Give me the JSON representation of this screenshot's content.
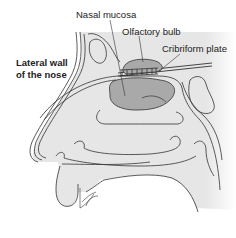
{
  "diagram": {
    "labels": {
      "nasal_mucosa": "Nasal mucosa",
      "olfactory_bulb": "Olfactory bulb",
      "cribriform_plate": "Cribriform plate",
      "lateral_wall_line1": "Lateral wall",
      "lateral_wall_line2": "of the nose"
    },
    "colors": {
      "tissue_fill": "#e4e4e4",
      "highlight_fill": "#a9a9a9",
      "outline": "#333333",
      "background": "#ffffff"
    }
  }
}
